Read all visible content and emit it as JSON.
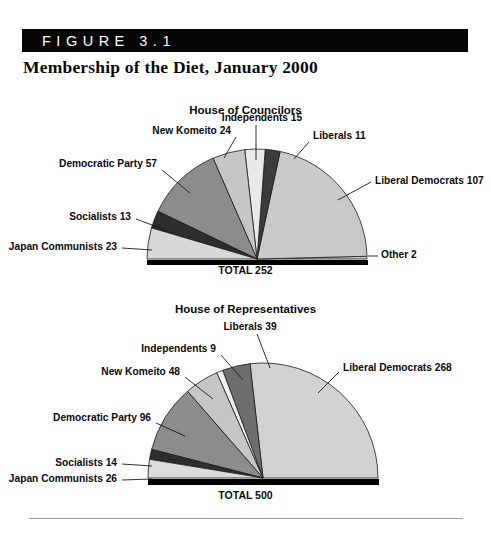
{
  "figure": {
    "banner_label": "FIGURE 3.1",
    "title": "Membership of the Diet, January 2000",
    "banner_color": "#050505"
  },
  "chart_data": [
    {
      "type": "pie",
      "title": "House of Councilors",
      "total_label": "TOTAL 252",
      "total": 252,
      "half_pie": true,
      "start_angle_deg": 0,
      "sweep_deg": 180,
      "direction": "counterclockwise",
      "categories": [
        "Other",
        "Liberal Democrats",
        "Liberals",
        "Independents",
        "New Komeito",
        "Democratic Party",
        "Socialists",
        "Japan Communists"
      ],
      "values": [
        2,
        107,
        11,
        15,
        24,
        57,
        13,
        23
      ],
      "labels": [
        "Other 2",
        "Liberal Democrats 107",
        "Liberals 11",
        "Independents 15",
        "New Komeito 24",
        "Democratic Party 57",
        "Socialists 13",
        "Japan Communists 23"
      ],
      "colors": [
        "#cfcfcf",
        "#c9c9c9",
        "#3c3c3c",
        "#e9e9e9",
        "#c6c6c6",
        "#8c8c8c",
        "#2e2e2e",
        "#d8d8d8"
      ],
      "label_positions": [
        {
          "anchor": "start",
          "x": 381,
          "y": 258,
          "lx1": 368,
          "ly1": 256,
          "lx2": 378,
          "ly2": 256
        },
        {
          "anchor": "start",
          "x": 375,
          "y": 184,
          "lx1": 338,
          "ly1": 200,
          "lx2": 371,
          "ly2": 182
        },
        {
          "anchor": "start",
          "x": 313,
          "y": 139,
          "lx1": 294,
          "ly1": 159,
          "lx2": 309,
          "ly2": 142
        },
        {
          "anchor": "mid",
          "x": 262,
          "y": 121,
          "lx1": 256,
          "ly1": 160,
          "lx2": 256,
          "ly2": 125
        },
        {
          "anchor": "end",
          "x": 231,
          "y": 134,
          "lx1": 224,
          "ly1": 158,
          "lx2": 236,
          "ly2": 137
        },
        {
          "anchor": "end",
          "x": 157,
          "y": 167,
          "lx1": 190,
          "ly1": 193,
          "lx2": 162,
          "ly2": 170
        },
        {
          "anchor": "end",
          "x": 131,
          "y": 220,
          "lx1": 168,
          "ly1": 231,
          "lx2": 136,
          "ly2": 219
        },
        {
          "anchor": "end",
          "x": 117,
          "y": 250,
          "lx1": 152,
          "ly1": 250,
          "lx2": 122,
          "ly2": 248
        }
      ]
    },
    {
      "type": "pie",
      "title": "House of Representatives",
      "total_label": "TOTAL 500",
      "total": 500,
      "half_pie": true,
      "start_angle_deg": 0,
      "sweep_deg": 180,
      "direction": "counterclockwise",
      "categories": [
        "Liberal Democrats",
        "Liberals",
        "Independents",
        "New Komeito",
        "Democratic Party",
        "Socialists",
        "Japan Communists"
      ],
      "values": [
        268,
        39,
        9,
        48,
        96,
        14,
        26
      ],
      "labels": [
        "Liberal Democrats 268",
        "Liberals 39",
        "Independents 9",
        "New Komeito 48",
        "Democratic Party 96",
        "Socialists 14",
        "Japan Communists 26"
      ],
      "colors": [
        "#d2d2d2",
        "#6e6e6e",
        "#efefef",
        "#c6c6c6",
        "#8c8c8c",
        "#2e2e2e",
        "#dcdcdc"
      ],
      "label_positions": [
        {
          "anchor": "start",
          "x": 343,
          "y": 371,
          "lx1": 318,
          "ly1": 393,
          "lx2": 339,
          "ly2": 372
        },
        {
          "anchor": "mid",
          "x": 250,
          "y": 330,
          "lx1": 270,
          "ly1": 368,
          "lx2": 257,
          "ly2": 334
        },
        {
          "anchor": "end",
          "x": 216,
          "y": 352,
          "lx1": 243,
          "ly1": 380,
          "lx2": 221,
          "ly2": 355
        },
        {
          "anchor": "end",
          "x": 180,
          "y": 375,
          "lx1": 213,
          "ly1": 399,
          "lx2": 185,
          "ly2": 377
        },
        {
          "anchor": "end",
          "x": 151,
          "y": 421,
          "lx1": 185,
          "ly1": 436,
          "lx2": 156,
          "ly2": 423
        },
        {
          "anchor": "end",
          "x": 117,
          "y": 466,
          "lx1": 152,
          "ly1": 466,
          "lx2": 122,
          "ly2": 464
        },
        {
          "anchor": "end",
          "x": 117,
          "y": 482,
          "lx1": 152,
          "ly1": 479,
          "lx2": 122,
          "ly2": 480
        }
      ]
    }
  ],
  "geometry": {
    "pie1": {
      "cx": 257,
      "cy": 259,
      "r": 110,
      "base_y": 260,
      "base_x1": 147,
      "base_x2": 368,
      "base_h": 5
    },
    "pie2": {
      "cx": 263,
      "cy": 478,
      "r": 115,
      "base_y": 479,
      "base_x1": 148,
      "base_x2": 379,
      "base_h": 6
    }
  }
}
